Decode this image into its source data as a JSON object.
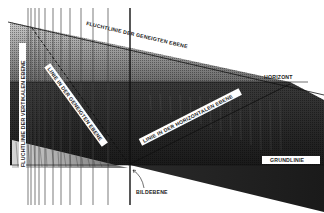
{
  "diagram": {
    "labels": {
      "vanishing_line_inclined": "FLUCHTLINIE DER GENEIGTEN EBENE",
      "vanishing_line_vertical": "FLUCHTLINIE DER VERTIKALEN EBENE",
      "line_in_inclined_plane": "LINIE IN DER GENEIGTEN EBENE",
      "line_in_horizontal_plane": "LINIE IN DER HORIZONTALEN EBENE",
      "horizon": "HORIZONT",
      "ground_line": "GRUNDLINIE",
      "picture_plane": "BILDEBENE"
    },
    "colors": {
      "background": "#ffffff",
      "ink": "#111111",
      "dark_fill": "#1e1e1e",
      "mid_fill": "#555555",
      "light_fill": "#a8a8a8",
      "label_box": "#ffffff"
    }
  }
}
